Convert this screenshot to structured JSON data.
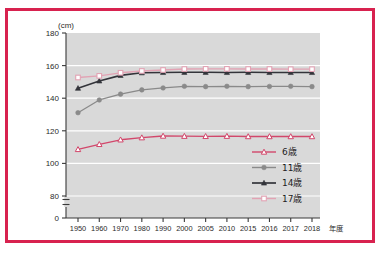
{
  "figure": {
    "border_color": "#d8224f",
    "plot_background": "#d9d9d9",
    "gridline_color": "#ffffff"
  },
  "chart_data": {
    "type": "line",
    "title": "",
    "xlabel": "年度",
    "ylabel": "(cm)",
    "unit_label": "(cm)",
    "grid": true,
    "legend_position": "inside-bottom-right",
    "ylim": [
      0,
      180
    ],
    "yticks": [
      0,
      80,
      100,
      120,
      140,
      160,
      180
    ],
    "y_axis_break": true,
    "y_axis_break_between": [
      0,
      80
    ],
    "categories": [
      "1950",
      "1960",
      "1970",
      "1980",
      "1990",
      "2000",
      "2005",
      "2010",
      "2015",
      "2016",
      "2017",
      "2018"
    ],
    "series": [
      {
        "name": "6歳",
        "color": "#d2476b",
        "marker": "open-triangle",
        "values": [
          108.6,
          111.7,
          114.5,
          115.8,
          116.8,
          116.7,
          116.6,
          116.7,
          116.5,
          116.5,
          116.5,
          116.5
        ]
      },
      {
        "name": "11歳",
        "color": "#8a8a8a",
        "marker": "filled-circle",
        "values": [
          131.1,
          138.9,
          142.5,
          145.1,
          146.3,
          147.3,
          147.1,
          147.3,
          147.1,
          147.2,
          147.3,
          147.1
        ]
      },
      {
        "name": "14歳",
        "color": "#33343a",
        "marker": "filled-triangle",
        "values": [
          146.1,
          150.6,
          154.0,
          155.6,
          155.8,
          155.9,
          155.9,
          155.8,
          155.9,
          155.8,
          155.8,
          155.8
        ]
      },
      {
        "name": "17歳",
        "color": "#e2a3b4",
        "marker": "open-square",
        "values": [
          152.7,
          153.7,
          155.6,
          156.7,
          157.3,
          157.9,
          158.0,
          158.0,
          157.9,
          157.9,
          157.8,
          157.8
        ]
      }
    ]
  },
  "legend": {
    "items": [
      {
        "label": "6歳"
      },
      {
        "label": "11歳"
      },
      {
        "label": "14歳"
      },
      {
        "label": "17歳"
      }
    ]
  },
  "axes": {
    "y_tick_labels": [
      "180",
      "160",
      "140",
      "120",
      "100",
      "80",
      "0"
    ],
    "x_tick_labels": [
      "1950",
      "1960",
      "1970",
      "1980",
      "1990",
      "2000",
      "2005",
      "2010",
      "2015",
      "2016",
      "2017",
      "2018"
    ],
    "x_axis_caption": "年度",
    "y_axis_caption": "(cm)"
  }
}
